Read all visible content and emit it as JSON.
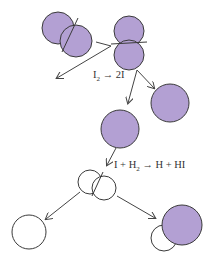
{
  "diagram": {
    "colors": {
      "iodine_fill": "#b3a0d3",
      "hydrogen_fill": "#ffffff",
      "stroke": "#3a3a3a",
      "arrow": "#444444",
      "background": "#ffffff"
    },
    "labels": {
      "dissociation": {
        "prefix": "I",
        "sub": "2",
        "rest": " → 2I"
      },
      "reaction": {
        "p1": "I + H",
        "sub": "2",
        "p2": " → H + HI"
      }
    },
    "molecules": [
      {
        "name": "I2-molecule-left",
        "type": "I2"
      },
      {
        "name": "I2-molecule-dissociating",
        "type": "I2"
      },
      {
        "name": "I-atom-right",
        "type": "I"
      },
      {
        "name": "I-atom-middle",
        "type": "I"
      },
      {
        "name": "H2-molecule",
        "type": "H2"
      },
      {
        "name": "H-atom",
        "type": "H"
      },
      {
        "name": "HI-molecule",
        "type": "HI"
      }
    ]
  }
}
